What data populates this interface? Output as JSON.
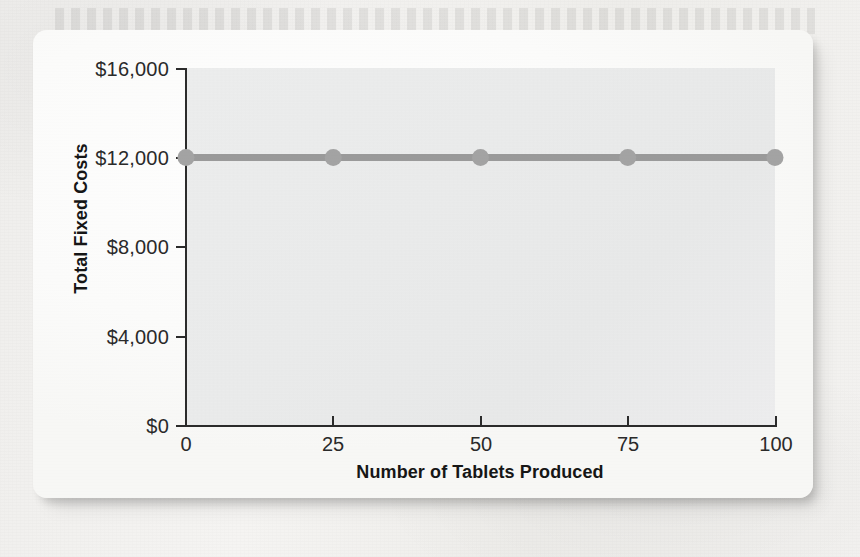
{
  "figure": {
    "kind": "line-chart-figure-card"
  },
  "chart_data": {
    "type": "line",
    "title": "",
    "subtitle": "",
    "xlabel": "Number of Tablets Produced",
    "ylabel": "Total Fixed Costs",
    "x": [
      0,
      25,
      50,
      75,
      100
    ],
    "xtick_labels": [
      "0",
      "25",
      "50",
      "75",
      "100"
    ],
    "xlim": [
      0,
      100
    ],
    "ytick_values": [
      0,
      4000,
      8000,
      12000,
      16000
    ],
    "ytick_labels": [
      "$0",
      "$4,000",
      "$8,000",
      "$12,000",
      "$16,000"
    ],
    "ylim": [
      0,
      16000
    ],
    "grid": false,
    "legend": false,
    "legend_position": "none",
    "series": [
      {
        "name": "Total fixed costs",
        "values": [
          12000,
          12000,
          12000,
          12000,
          12000
        ],
        "color": "#9a9a9a",
        "marker": "circle",
        "marker_color": "#a3a3a3",
        "line_width": 7
      }
    ],
    "annotations": [],
    "colors": {
      "plot_background": "#eaebeb",
      "card_background": "#fbfbfa",
      "axis": "#2b2b2b",
      "tick_label": "#2a2a2a",
      "axis_title": "#161616",
      "series": "#9a9a9a"
    }
  }
}
